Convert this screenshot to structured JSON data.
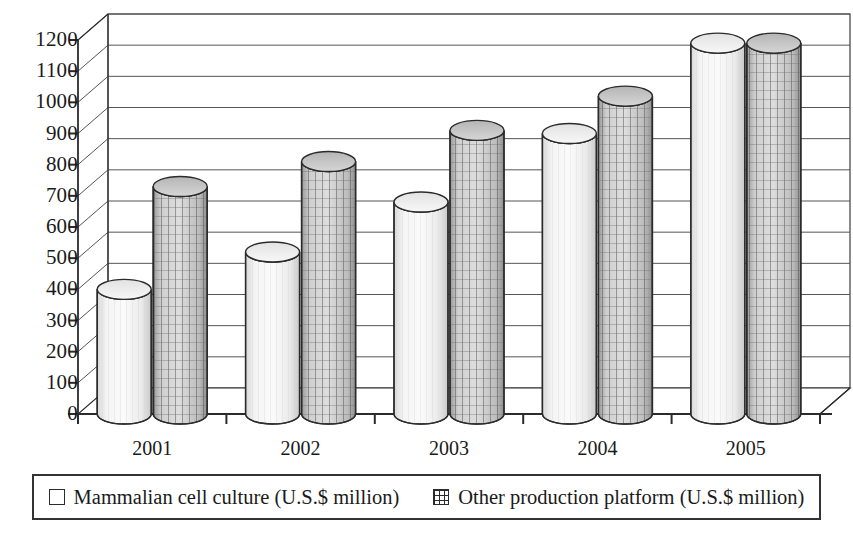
{
  "chart_data": {
    "type": "bar",
    "title": "",
    "subtitle": "",
    "xlabel": "",
    "ylabel": "",
    "categories": [
      "2001",
      "2002",
      "2003",
      "2004",
      "2005"
    ],
    "series": [
      {
        "name": "Mammalian cell culture (U.S.$ million)",
        "marker": "empty-square",
        "values": [
          400,
          520,
          680,
          900,
          1190
        ]
      },
      {
        "name": "Other production platform (U.S.$ million)",
        "marker": "grid-square",
        "values": [
          730,
          810,
          910,
          1020,
          1190
        ]
      }
    ],
    "ylim": [
      0,
      1200
    ],
    "ytick_values": [
      1200,
      1100,
      1000,
      900,
      800,
      700,
      600,
      500,
      400,
      300,
      200,
      100,
      0
    ],
    "ytick_labels": [
      "1200",
      "1100",
      "1000",
      "900",
      "800",
      "700",
      "600",
      "500",
      "400",
      "300",
      "200",
      "100",
      "0"
    ],
    "grid": true,
    "grid_orientation": "horizontal",
    "legend_position": "bottom",
    "style": "3d-cylinder",
    "colors": {
      "series1_fill": "#efefef",
      "series1_edge": "#2b2b2b",
      "series2_fill": "#b9b9b9",
      "series2_edge": "#2b2b2b",
      "axis": "#2b2b2b",
      "gridline": "#555555",
      "background": "#ffffff",
      "legend_border": "#333333"
    }
  },
  "legend": {
    "entries": [
      {
        "label": "Mammalian cell culture (U.S.$ million)",
        "marker": "empty-square"
      },
      {
        "label": "Other production platform (U.S.$ million)",
        "marker": "grid-square"
      }
    ]
  }
}
